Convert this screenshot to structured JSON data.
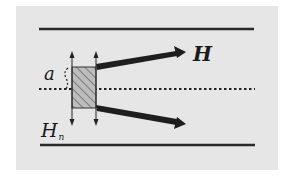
{
  "diagram": {
    "labels": {
      "field": "H",
      "height": "a",
      "normal_field_base": "H",
      "normal_field_sub": "n"
    },
    "colors": {
      "background": "#e6e6e6",
      "lines": "#222222",
      "hatch": "#555555",
      "hatch_fill": "#bdbdbd"
    },
    "elements": {
      "top_plate": "solid line",
      "bottom_plate": "solid line",
      "center_line": "dotted line",
      "control_region": "hatched rectangle",
      "vertical_arrows": 2,
      "diverging_arrows": 2
    }
  }
}
